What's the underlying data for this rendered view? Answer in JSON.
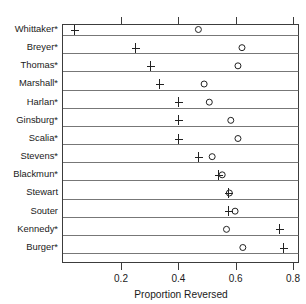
{
  "chart_data": {
    "type": "scatter",
    "title": "",
    "xlabel": "Proportion Reversed",
    "ylabel": "",
    "xlim": [
      0.0,
      0.845
    ],
    "xticks": [
      0.2,
      0.4,
      0.6,
      0.8
    ],
    "xticklabels": [
      "0.2",
      "0.4",
      "0.6",
      "0.8"
    ],
    "grid": false,
    "legend": false,
    "categories": [
      "Whittaker*",
      "Breyer*",
      "Thomas*",
      "Marshall*",
      "Harlan*",
      "Ginsburg*",
      "Scalia*",
      "Stevens*",
      "Blackmun*",
      "Stewart",
      "Souter",
      "Kennedy*",
      "Burger*"
    ],
    "series": [
      {
        "name": "plus",
        "marker": "plus",
        "values": [
          0.035,
          0.25,
          0.3,
          0.333,
          0.4,
          0.4,
          0.4,
          0.468,
          0.538,
          0.573,
          0.573,
          0.75,
          0.765
        ]
      },
      {
        "name": "circle",
        "marker": "circle",
        "values": [
          0.47,
          0.622,
          0.608,
          0.49,
          0.508,
          0.583,
          0.608,
          0.518,
          0.553,
          0.578,
          0.598,
          0.568,
          0.625
        ]
      }
    ]
  },
  "colors": {
    "background": "#ffffff",
    "axis": "#3c3c3c",
    "rowline": "#555555",
    "marker": "#222222",
    "text": "#1a1a1a"
  }
}
